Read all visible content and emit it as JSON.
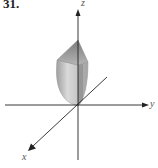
{
  "figure": {
    "problem_number": "31.",
    "axes": {
      "z_label": "z",
      "y_label": "y",
      "x_label": "x"
    },
    "colors": {
      "axis": "#222222",
      "solid_light": "#d9d9d9",
      "solid_mid": "#bdbdbd",
      "solid_dark": "#8c8c8c",
      "label": "#555555"
    }
  }
}
